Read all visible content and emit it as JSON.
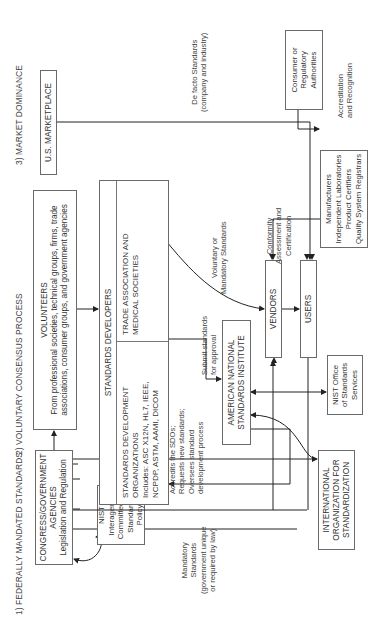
{
  "sections": {
    "federal": "1) FEDERALLY MANDATED STANDARDS",
    "voluntary": "2) VOLUNTARY CONSENSUS PROCESS",
    "market": "3) MARKET DOMINANCE"
  },
  "nodes": {
    "congress": {
      "lines": [
        "CONGRESS/GOVERNMENT",
        "AGENCIES",
        "Legislation and Regulation"
      ]
    },
    "nist_interagency": {
      "lines": [
        "NIST",
        "Interagency",
        "Committee on",
        "Standards Policy"
      ]
    },
    "volunteers": {
      "lines": [
        "VOLUNTEERS",
        "From professional societies, technical groups, firms, trade",
        "associations, consumer groups, and government agencies"
      ]
    },
    "standards_developers": {
      "title": "STANDARDS DEVELOPERS",
      "sdo": [
        "STANDARDS DEVELOPMENT",
        "ORGANIZATIONS",
        "Includes: ASC X12N, HL7, IEEE,",
        "NCPDP, ASTM, AAMI, DICOM"
      ],
      "trade": [
        "TRADE ASSOCIATION AND",
        "MEDICAL SOCIETIES"
      ]
    },
    "ansi": {
      "lines": [
        "AMERICAN NATIONAL",
        "STANDARDS INSTITUTE"
      ]
    },
    "nist_office": {
      "lines": [
        "NIST Office",
        "of Standards",
        "Services"
      ]
    },
    "iso": {
      "lines": [
        "INTERNATIONAL",
        "ORGANIZATION FOR",
        "STANDARDIZATION"
      ]
    },
    "marketplace": {
      "lines": [
        "U.S. MARKETPLACE"
      ]
    },
    "vendors": {
      "lines": [
        "VENDORS"
      ]
    },
    "users": {
      "lines": [
        "USERS"
      ]
    },
    "manufacturers": {
      "lines": [
        "Manufacturers",
        "Independent Laboratories",
        "Product Certifiers",
        "Quality System Registrars"
      ]
    },
    "consumer": {
      "lines": [
        "Consumer or",
        "Regulatory",
        "Authorities"
      ]
    }
  },
  "edge_labels": {
    "mandatory": [
      "Mandatory",
      "Standards",
      "(government unique",
      "or required by law)"
    ],
    "accredits": [
      "Accredits the SDOs;",
      "Requests new standards;",
      "Oversees standard",
      "development process"
    ],
    "submit": [
      "Submit standards",
      "for approval"
    ],
    "voluntary_or_mandatory": [
      "Voluntary or",
      "Mandatory Standards"
    ],
    "conformity": [
      "Conformity",
      "Assessment and",
      "Certification"
    ],
    "de_facto": [
      "De facto Standards",
      "(company and industry)"
    ],
    "accreditation": [
      "Accreditation",
      "and Recognition"
    ]
  },
  "colors": {
    "line": "#222222",
    "box_border": "#6a6a6a",
    "text": "#333333",
    "background": "#ffffff"
  }
}
